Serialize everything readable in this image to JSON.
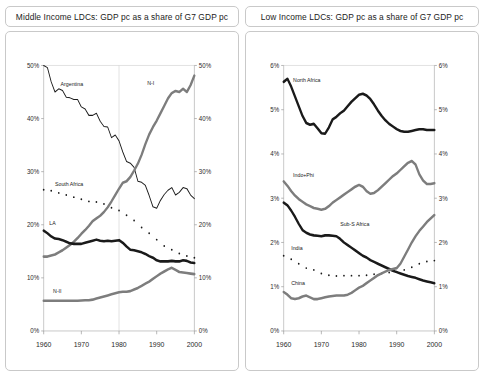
{
  "panels": [
    {
      "id": "middle-income",
      "title": "Middle Income LDCs: GDP pc as a share of G7 GDP pc",
      "chart": {
        "type": "line",
        "title": "Middle Income LDCs: GDP pc as a share of G7 GDP pc",
        "xlabel": "",
        "ylabel": "",
        "xlim": [
          1960,
          2000
        ],
        "ylim": [
          0,
          50
        ],
        "xticks": [
          "1960",
          "1970",
          "1980",
          "1990",
          "2000"
        ],
        "xtick_values": [
          1960,
          1970,
          1980,
          1990,
          2000
        ],
        "yticks": [
          "0%",
          "10%",
          "20%",
          "30%",
          "40%",
          "50%"
        ],
        "ytick_values": [
          0,
          10,
          20,
          30,
          40,
          50
        ],
        "yticks_right": [
          "0%",
          "10%",
          "20%",
          "30%",
          "40%",
          "50%"
        ],
        "grid": "horizontal-top-and-vertical-1980",
        "legend": "inline-labels",
        "x": [
          1960,
          1961,
          1962,
          1963,
          1964,
          1965,
          1966,
          1967,
          1968,
          1969,
          1970,
          1971,
          1972,
          1973,
          1974,
          1975,
          1976,
          1977,
          1978,
          1979,
          1980,
          1981,
          1982,
          1983,
          1984,
          1985,
          1986,
          1987,
          1988,
          1989,
          1990,
          1991,
          1992,
          1993,
          1994,
          1995,
          1996,
          1997,
          1998,
          1999,
          2000
        ],
        "series": [
          {
            "name": "Argentina",
            "style": "thin-solid-black",
            "color": "#1a1a1a",
            "width": 0.9,
            "label_x": 1964.5,
            "label_y": 46.2,
            "values": [
              50.0,
              49.6,
              46.9,
              45.0,
              45.6,
              45.3,
              44.0,
              43.9,
              43.6,
              43.6,
              42.2,
              41.8,
              40.6,
              40.6,
              41.0,
              39.5,
              38.5,
              38.4,
              36.4,
              36.9,
              35.8,
              33.7,
              31.9,
              31.6,
              30.8,
              28.2,
              28.0,
              27.4,
              25.5,
              23.4,
              23.1,
              24.6,
              25.7,
              26.5,
              27.0,
              25.6,
              26.1,
              27.0,
              26.8,
              25.6,
              24.9
            ]
          },
          {
            "name": "N-I",
            "style": "thick-solid-gray",
            "color": "#7d7d7d",
            "width": 2.3,
            "label_x": 1987.5,
            "label_y": 46.3,
            "values": [
              14.0,
              14.0,
              14.2,
              14.4,
              14.8,
              15.2,
              15.7,
              16.2,
              16.8,
              17.5,
              18.3,
              19.0,
              19.8,
              20.7,
              21.2,
              21.7,
              22.4,
              23.3,
              24.4,
              25.6,
              26.8,
              27.9,
              28.2,
              29.0,
              30.2,
              31.5,
              33.2,
              35.2,
              37.0,
              38.4,
              39.6,
              41.0,
              42.4,
              43.8,
              44.8,
              45.2,
              45.0,
              45.6,
              45.0,
              46.3,
              48.1
            ]
          },
          {
            "name": "South Africa",
            "style": "dotted-black",
            "color": "#1a1a1a",
            "width": 1.4,
            "label_x": 1963.0,
            "label_y": 27.3,
            "values": [
              26.6,
              26.5,
              26.4,
              26.3,
              26.0,
              25.7,
              25.6,
              25.5,
              25.2,
              25.0,
              24.8,
              24.7,
              24.4,
              24.2,
              24.3,
              24.1,
              23.9,
              23.5,
              23.2,
              23.0,
              22.7,
              22.3,
              21.8,
              21.1,
              20.8,
              20.2,
              19.5,
              18.9,
              18.4,
              17.9,
              17.2,
              16.6,
              16.0,
              15.6,
              15.3,
              15.0,
              14.6,
              14.4,
              14.1,
              13.9,
              13.8
            ]
          },
          {
            "name": "LA",
            "style": "thick-solid-black",
            "color": "#1a1a1a",
            "width": 2.3,
            "label_x": 1961.5,
            "label_y": 20.0,
            "values": [
              18.9,
              18.4,
              17.8,
              17.4,
              17.3,
              17.1,
              16.8,
              16.5,
              16.4,
              16.4,
              16.4,
              16.6,
              16.8,
              17.0,
              17.2,
              17.0,
              16.9,
              17.0,
              16.9,
              17.0,
              17.1,
              16.6,
              15.9,
              15.3,
              15.2,
              15.0,
              14.8,
              14.5,
              14.1,
              13.8,
              13.3,
              13.1,
              13.1,
              13.1,
              13.2,
              13.1,
              13.1,
              13.3,
              13.2,
              12.9,
              12.8
            ]
          },
          {
            "name": "N-II",
            "style": "thick-solid-gray",
            "color": "#7d7d7d",
            "width": 2.3,
            "label_x": 1962.5,
            "label_y": 7.1,
            "values": [
              5.7,
              5.7,
              5.7,
              5.7,
              5.7,
              5.7,
              5.7,
              5.7,
              5.7,
              5.7,
              5.75,
              5.8,
              5.8,
              5.9,
              6.1,
              6.3,
              6.5,
              6.7,
              6.9,
              7.1,
              7.3,
              7.4,
              7.4,
              7.5,
              7.8,
              8.1,
              8.5,
              8.9,
              9.3,
              9.8,
              10.3,
              10.8,
              11.2,
              11.6,
              11.9,
              11.5,
              11.1,
              11.0,
              10.9,
              10.8,
              10.7
            ]
          }
        ]
      }
    },
    {
      "id": "low-income",
      "title": "Low Income LDCs: GDP pc as a share of G7 GDP pc",
      "chart": {
        "type": "line",
        "title": "Low Income LDCs: GDP pc as a share of G7 GDP pc",
        "xlabel": "",
        "ylabel": "",
        "xlim": [
          1960,
          2000
        ],
        "ylim": [
          0,
          6
        ],
        "xticks": [
          "1960",
          "1970",
          "1980",
          "1990",
          "2000"
        ],
        "xtick_values": [
          1960,
          1970,
          1980,
          1990,
          2000
        ],
        "yticks": [
          "0%",
          "1%",
          "2%",
          "3%",
          "4%",
          "5%",
          "6%"
        ],
        "ytick_values": [
          0,
          1,
          2,
          3,
          4,
          5,
          6
        ],
        "yticks_right": [
          "0%",
          "1%",
          "2%",
          "3%",
          "4%",
          "5%",
          "6%"
        ],
        "grid": "horizontal-top",
        "legend": "inline-labels",
        "x": [
          1960,
          1961,
          1962,
          1963,
          1964,
          1965,
          1966,
          1967,
          1968,
          1969,
          1970,
          1971,
          1972,
          1973,
          1974,
          1975,
          1976,
          1977,
          1978,
          1979,
          1980,
          1981,
          1982,
          1983,
          1984,
          1985,
          1986,
          1987,
          1988,
          1989,
          1990,
          1991,
          1992,
          1993,
          1994,
          1995,
          1996,
          1997,
          1998,
          1999,
          2000
        ],
        "series": [
          {
            "name": "North Africa",
            "style": "thick-solid-black",
            "color": "#1a1a1a",
            "width": 2.3,
            "label_x": 1962.5,
            "label_y": 5.62,
            "values": [
              5.63,
              5.7,
              5.52,
              5.3,
              5.08,
              4.86,
              4.7,
              4.66,
              4.68,
              4.58,
              4.47,
              4.46,
              4.6,
              4.78,
              4.84,
              4.92,
              4.98,
              5.08,
              5.18,
              5.26,
              5.34,
              5.36,
              5.32,
              5.24,
              5.12,
              4.98,
              4.86,
              4.76,
              4.68,
              4.62,
              4.56,
              4.52,
              4.5,
              4.5,
              4.52,
              4.54,
              4.56,
              4.56,
              4.54,
              4.54,
              4.54
            ]
          },
          {
            "name": "Indo+Phi",
            "style": "thick-solid-gray",
            "color": "#7d7d7d",
            "width": 2.3,
            "label_x": 1962.5,
            "label_y": 3.48,
            "values": [
              3.38,
              3.28,
              3.16,
              3.06,
              2.98,
              2.92,
              2.86,
              2.82,
              2.78,
              2.76,
              2.74,
              2.76,
              2.82,
              2.9,
              2.96,
              3.02,
              3.08,
              3.14,
              3.2,
              3.26,
              3.3,
              3.26,
              3.16,
              3.1,
              3.12,
              3.18,
              3.26,
              3.34,
              3.42,
              3.5,
              3.56,
              3.64,
              3.72,
              3.8,
              3.84,
              3.76,
              3.54,
              3.4,
              3.32,
              3.32,
              3.34
            ]
          },
          {
            "name": "Sub-S Africa",
            "style": "thick-solid-black",
            "color": "#1a1a1a",
            "width": 2.3,
            "label_x": 1975.0,
            "label_y": 2.38,
            "values": [
              2.9,
              2.84,
              2.72,
              2.58,
              2.42,
              2.28,
              2.22,
              2.18,
              2.16,
              2.15,
              2.14,
              2.16,
              2.16,
              2.15,
              2.14,
              2.08,
              2.0,
              1.94,
              1.88,
              1.82,
              1.76,
              1.7,
              1.66,
              1.6,
              1.56,
              1.52,
              1.48,
              1.44,
              1.4,
              1.36,
              1.33,
              1.3,
              1.27,
              1.24,
              1.22,
              1.2,
              1.17,
              1.14,
              1.12,
              1.1,
              1.08
            ]
          },
          {
            "name": "India",
            "style": "dotted-black",
            "color": "#1a1a1a",
            "width": 1.4,
            "label_x": 1962.0,
            "label_y": 1.82,
            "values": [
              1.7,
              1.68,
              1.62,
              1.56,
              1.52,
              1.46,
              1.42,
              1.4,
              1.38,
              1.34,
              1.3,
              1.28,
              1.26,
              1.25,
              1.24,
              1.24,
              1.25,
              1.25,
              1.25,
              1.25,
              1.25,
              1.26,
              1.26,
              1.27,
              1.28,
              1.29,
              1.3,
              1.31,
              1.32,
              1.33,
              1.34,
              1.35,
              1.38,
              1.41,
              1.44,
              1.48,
              1.52,
              1.55,
              1.57,
              1.58,
              1.59
            ]
          },
          {
            "name": "China",
            "style": "thick-solid-gray",
            "color": "#7d7d7d",
            "width": 2.3,
            "label_x": 1962.0,
            "label_y": 1.04,
            "values": [
              0.88,
              0.82,
              0.74,
              0.72,
              0.74,
              0.78,
              0.8,
              0.76,
              0.72,
              0.72,
              0.74,
              0.76,
              0.78,
              0.79,
              0.8,
              0.8,
              0.8,
              0.82,
              0.86,
              0.92,
              0.98,
              1.02,
              1.08,
              1.14,
              1.2,
              1.26,
              1.3,
              1.34,
              1.38,
              1.4,
              1.42,
              1.52,
              1.68,
              1.84,
              2.0,
              2.14,
              2.26,
              2.36,
              2.46,
              2.54,
              2.62
            ]
          }
        ]
      }
    }
  ],
  "colors": {
    "series_black": "#1a1a1a",
    "series_gray": "#7d7d7d",
    "border": "#c9c9c9",
    "grid": "#d0d0d0",
    "background": "#ffffff"
  }
}
